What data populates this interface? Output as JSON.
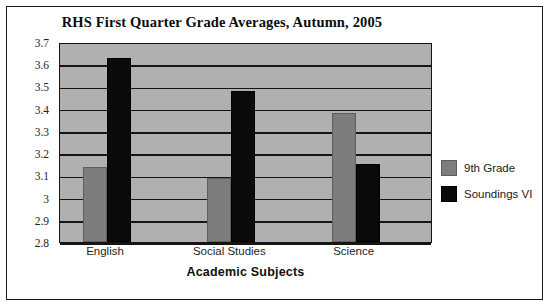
{
  "chart_data": {
    "type": "bar",
    "title": "RHS First Quarter Grade Averages, Autumn, 2005",
    "xlabel": "Academic Subjects",
    "ylabel": "",
    "categories": [
      "English",
      "Social Studies",
      "Science"
    ],
    "series": [
      {
        "name": "9th Grade",
        "color": "#7d7d7d",
        "values": [
          3.13,
          3.08,
          3.37
        ]
      },
      {
        "name": "Soundings VI",
        "color": "#0a0a0a",
        "values": [
          3.62,
          3.47,
          3.14
        ]
      }
    ],
    "ylim": [
      2.8,
      3.7
    ],
    "ytick_step": 0.1,
    "ytick_labels": [
      "3.7",
      "3.6",
      "3.5",
      "3.4",
      "3.3",
      "3.2",
      "3.1",
      "3",
      "2.9",
      "2.8"
    ],
    "ytick_values": [
      3.7,
      3.6,
      3.5,
      3.4,
      3.3,
      3.2,
      3.1,
      3.0,
      2.9,
      2.8
    ],
    "grid": true,
    "legend_position": "right",
    "plot_background": "#b0b0b0",
    "figure_background": "#ffffff",
    "grid_color": "#151515"
  }
}
